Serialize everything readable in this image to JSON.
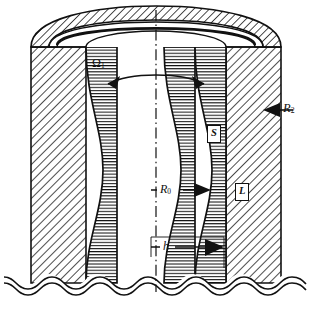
{
  "figure": {
    "background_color": "#ffffff",
    "line_color": "#111111",
    "canvas": {
      "width": 313,
      "height": 313
    }
  },
  "annotations": {
    "rotation": {
      "symbol": "Ω",
      "subscript": "1",
      "name": "angular-velocity",
      "arrow": "double-headed-curved-arrow"
    },
    "outer_radius": {
      "symbol": "R",
      "subscript": "2",
      "name": "outer-radius",
      "arrow": "left-pointing-solid-arrow"
    },
    "mid_radius": {
      "symbol": "R",
      "subscript": "0",
      "name": "reference-radius",
      "arrow": "right-pointing-solid-arrow"
    },
    "thickness": {
      "symbol": "h",
      "subscript": "",
      "name": "layer-thickness",
      "arrow": "right-pointing-solid-arrow"
    },
    "region_solid": {
      "symbol": "S",
      "name": "solid-region-label"
    },
    "region_liquid": {
      "symbol": "L",
      "name": "liquid-region-label"
    }
  },
  "geometry": {
    "centerline": {
      "style": "dash-dot",
      "x": 156
    },
    "break_line": {
      "style": "double-wavy",
      "y": 283
    },
    "hatching": {
      "outer_wall": "diagonal-45",
      "inner_layer": "horizontal",
      "dome": "diagonal-45"
    }
  }
}
